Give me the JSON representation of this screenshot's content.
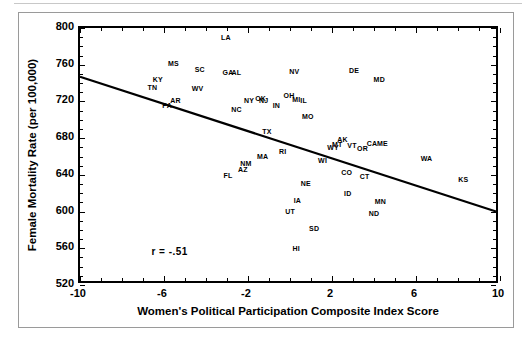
{
  "page": {
    "folio": ""
  },
  "chart_data": {
    "type": "scatter",
    "title": "",
    "xlabel": "Women's Political Participation Composite Index Score",
    "ylabel": "Female Mortality Rate (per 100,000)",
    "xlim": [
      -10,
      10
    ],
    "ylim": [
      520,
      800
    ],
    "xticks": [
      -10,
      -6,
      -2,
      2,
      6,
      10
    ],
    "yticks": [
      520,
      560,
      600,
      640,
      680,
      720,
      760,
      800
    ],
    "xtick_labels": [
      "-10",
      "-6",
      "-2",
      "2",
      "6",
      "10"
    ],
    "ytick_labels": [
      "520",
      "560",
      "600",
      "640",
      "680",
      "720",
      "760",
      "800"
    ],
    "grid": false,
    "legend": null,
    "annotations": [
      {
        "text": "r = -.51",
        "x": -6.6,
        "y": 556
      }
    ],
    "trendline": {
      "type": "linear",
      "x0": -10,
      "y0": 746,
      "x1": 10,
      "y1": 597,
      "slope": -7.45,
      "intercept": 671.5
    },
    "point_label_field": "state",
    "points": [
      {
        "state": "LA",
        "x": -3.05,
        "y": 790
      },
      {
        "state": "MS",
        "x": -5.55,
        "y": 762
      },
      {
        "state": "SC",
        "x": -4.3,
        "y": 755
      },
      {
        "state": "GA",
        "x": -2.95,
        "y": 752
      },
      {
        "state": "AL",
        "x": -2.55,
        "y": 752
      },
      {
        "state": "NV",
        "x": 0.2,
        "y": 753
      },
      {
        "state": "DE",
        "x": 3.05,
        "y": 754
      },
      {
        "state": "KY",
        "x": -6.3,
        "y": 744
      },
      {
        "state": "TN",
        "x": -6.55,
        "y": 736
      },
      {
        "state": "MD",
        "x": 4.25,
        "y": 744
      },
      {
        "state": "WV",
        "x": -4.4,
        "y": 735
      },
      {
        "state": "AR",
        "x": -5.45,
        "y": 722
      },
      {
        "state": "PA",
        "x": -5.85,
        "y": 716
      },
      {
        "state": "NY",
        "x": -1.95,
        "y": 722
      },
      {
        "state": "OK",
        "x": -1.4,
        "y": 724
      },
      {
        "state": "NJ",
        "x": -1.25,
        "y": 722
      },
      {
        "state": "OH",
        "x": -0.05,
        "y": 727
      },
      {
        "state": "MI",
        "x": 0.3,
        "y": 723
      },
      {
        "state": "IL",
        "x": 0.65,
        "y": 722
      },
      {
        "state": "IN",
        "x": -0.65,
        "y": 716
      },
      {
        "state": "NC",
        "x": -2.55,
        "y": 712
      },
      {
        "state": "MO",
        "x": 0.85,
        "y": 704
      },
      {
        "state": "TX",
        "x": -1.1,
        "y": 688
      },
      {
        "state": "AK",
        "x": 2.5,
        "y": 679
      },
      {
        "state": "MT",
        "x": 2.25,
        "y": 674
      },
      {
        "state": "WY",
        "x": 2.05,
        "y": 670
      },
      {
        "state": "VT",
        "x": 2.95,
        "y": 673
      },
      {
        "state": "OR",
        "x": 3.45,
        "y": 669
      },
      {
        "state": "CA",
        "x": 3.9,
        "y": 675
      },
      {
        "state": "ME",
        "x": 4.4,
        "y": 675
      },
      {
        "state": "RI",
        "x": -0.35,
        "y": 666
      },
      {
        "state": "MA",
        "x": -1.3,
        "y": 661
      },
      {
        "state": "NM",
        "x": -2.1,
        "y": 653
      },
      {
        "state": "AZ",
        "x": -2.25,
        "y": 646
      },
      {
        "state": "FL",
        "x": -2.95,
        "y": 640
      },
      {
        "state": "WI",
        "x": 1.55,
        "y": 656
      },
      {
        "state": "WA",
        "x": 6.5,
        "y": 658
      },
      {
        "state": "CO",
        "x": 2.7,
        "y": 643
      },
      {
        "state": "CT",
        "x": 3.55,
        "y": 639
      },
      {
        "state": "KS",
        "x": 8.25,
        "y": 635
      },
      {
        "state": "NE",
        "x": 0.75,
        "y": 631
      },
      {
        "state": "ID",
        "x": 2.75,
        "y": 620
      },
      {
        "state": "IA",
        "x": 0.35,
        "y": 613
      },
      {
        "state": "MN",
        "x": 4.3,
        "y": 612
      },
      {
        "state": "UT",
        "x": 0.0,
        "y": 601
      },
      {
        "state": "ND",
        "x": 4.0,
        "y": 598
      },
      {
        "state": "SD",
        "x": 1.15,
        "y": 582
      },
      {
        "state": "HI",
        "x": 0.3,
        "y": 560
      }
    ]
  }
}
